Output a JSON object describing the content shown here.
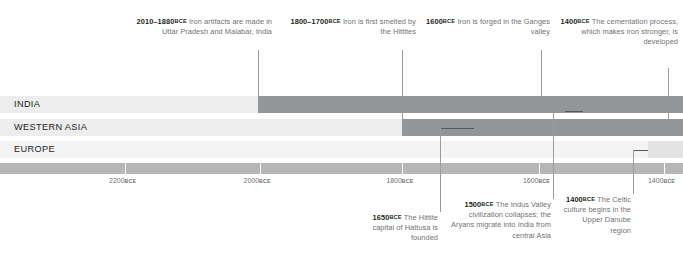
{
  "rows": [
    {
      "label": "INDIA",
      "base_color": "#ededee",
      "active_color": "#939598",
      "active_start_pct": 37.8,
      "active_end_pct": 100
    },
    {
      "label": "WESTERN ASIA",
      "base_color": "#ededee",
      "active_color": "#939598",
      "active_start_pct": 58.9,
      "active_end_pct": 100
    },
    {
      "label": "EUROPE",
      "base_color": "#f4f4f5",
      "active_color": "#e3e3e4",
      "active_start_pct": 94.9,
      "active_end_pct": 100
    }
  ],
  "axis": {
    "bar_color": "#b4b6b8",
    "ticks": [
      {
        "label": "2200",
        "era": "BCE",
        "pct": 18.3
      },
      {
        "label": "2000",
        "era": "BCE",
        "pct": 38.0
      },
      {
        "label": "1800",
        "era": "BCE",
        "pct": 58.9
      },
      {
        "label": "1600",
        "era": "BCE",
        "pct": 78.9
      },
      {
        "label": "1400",
        "era": "BCE",
        "pct": 97.2
      }
    ]
  },
  "notes_top": [
    {
      "year": "2010–1880",
      "era": "BCE",
      "text": " Iron artifacts are made in Uttar Pradesh and Malabar, India"
    },
    {
      "year": "1800–1700",
      "era": "BCE",
      "text": " Iron is first smelted by the Hittites"
    },
    {
      "year": "1600",
      "era": "BCE",
      "text": " Iron is forged in the Ganges valley"
    },
    {
      "year": "1400",
      "era": "BCE",
      "text": " The cementation process, which makes iron stronger, is developed"
    }
  ],
  "notes_bottom": [
    {
      "year": "1650",
      "era": "BCE",
      "text": " The Hittite capital of Hattusa is founded"
    },
    {
      "year": "1500",
      "era": "BCE",
      "text": " The Indus Valley civilization collapses; the Aryans migrate into India from central Asia"
    },
    {
      "year": "1400",
      "era": "BCE",
      "text": " The Celtic culture begins in the Upper Danube region"
    }
  ]
}
